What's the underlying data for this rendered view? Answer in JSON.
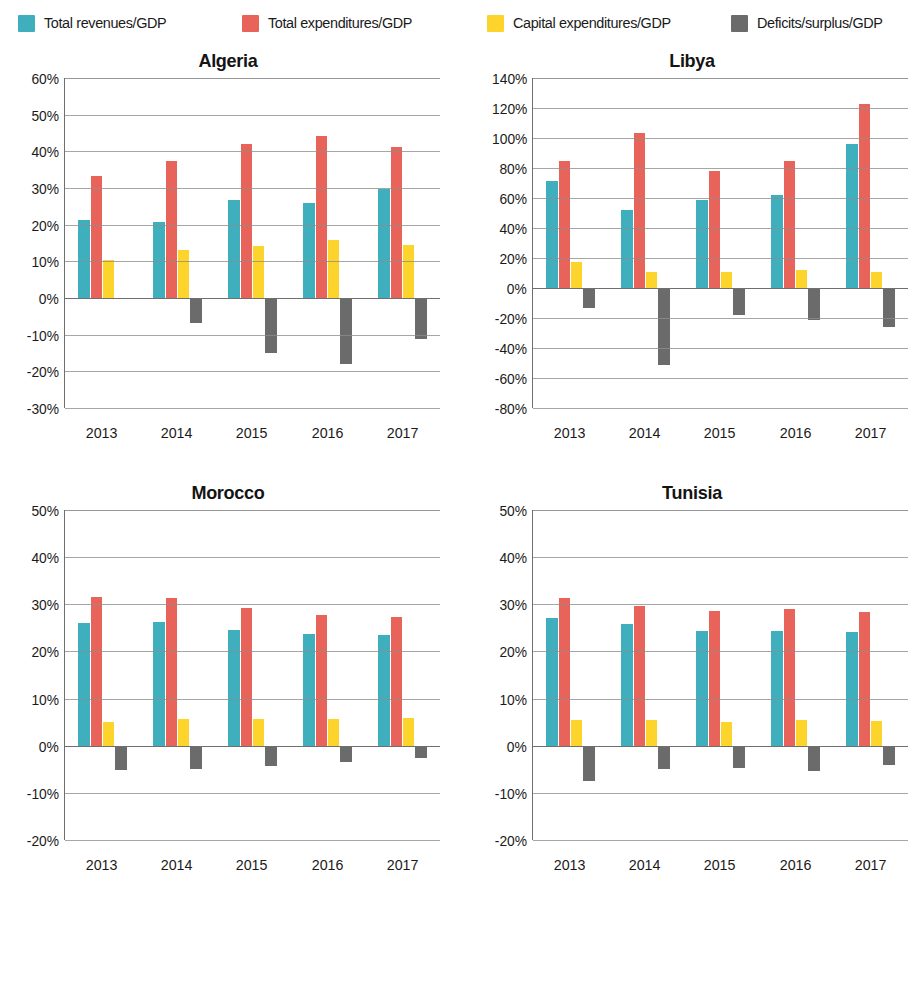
{
  "legend": {
    "items": [
      {
        "label": "Total revenues/GDP",
        "color": "#3FAFBE",
        "x": 18,
        "icon": "legend-swatch-teal"
      },
      {
        "label": "Total expenditures/GDP",
        "color": "#E8635A",
        "x": 242,
        "icon": "legend-swatch-red"
      },
      {
        "label": "Capital expenditures/GDP",
        "color": "#FCD42B",
        "x": 487,
        "icon": "legend-swatch-yellow"
      },
      {
        "label": "Deficits/surplus/GDP",
        "color": "#6B6B6B",
        "x": 731,
        "icon": "legend-swatch-gray"
      }
    ]
  },
  "colors": {
    "revenues": "#3FAFBE",
    "expenditures": "#E8635A",
    "capital": "#FCD42B",
    "deficit": "#6B6B6B",
    "axis": "#6F6F6F",
    "grid": "#8D8D8D",
    "text": "#1A1A1A"
  },
  "chart_data": [
    {
      "type": "bar",
      "title": "Algeria",
      "xlabel": "",
      "ylabel": "",
      "categories": [
        "2013",
        "2014",
        "2015",
        "2016",
        "2017"
      ],
      "ylim": [
        -30,
        60
      ],
      "ytick_step": 10,
      "ytick_labels": [
        "60%",
        "50%",
        "40%",
        "30%",
        "20%",
        "10%",
        "0%",
        "-10%",
        "-20%",
        "-30%"
      ],
      "grid": true,
      "legend_position": "top",
      "series": [
        {
          "name": "Total revenues/GDP",
          "color": "#3FAFBE",
          "values": [
            21.4,
            20.8,
            26.8,
            26.0,
            29.6
          ]
        },
        {
          "name": "Total expenditures/GDP",
          "color": "#E8635A",
          "values": [
            33.3,
            37.4,
            42.1,
            44.3,
            41.2
          ]
        },
        {
          "name": "Capital expenditures/GDP",
          "color": "#FCD42B",
          "values": [
            10.3,
            13.2,
            14.1,
            15.7,
            14.4
          ]
        },
        {
          "name": "Deficits/surplus/GDP",
          "color": "#6B6B6B",
          "values": [
            -0.3,
            -6.8,
            -15.0,
            -18.0,
            -11.2
          ]
        }
      ]
    },
    {
      "type": "bar",
      "title": "Libya",
      "xlabel": "",
      "ylabel": "",
      "categories": [
        "2013",
        "2014",
        "2015",
        "2016",
        "2017"
      ],
      "ylim": [
        -80,
        140
      ],
      "ytick_step": 20,
      "ytick_labels": [
        "140%",
        "120%",
        "100%",
        "80%",
        "60%",
        "40%",
        "20%",
        "0%",
        "-20%",
        "-40%",
        "-60%",
        "-80%"
      ],
      "grid": true,
      "legend_position": "top",
      "series": [
        {
          "name": "Total revenues/GDP",
          "color": "#3FAFBE",
          "values": [
            71.5,
            52.0,
            58.5,
            62.0,
            96.0
          ]
        },
        {
          "name": "Total expenditures/GDP",
          "color": "#E8635A",
          "values": [
            85.0,
            103.5,
            78.0,
            85.0,
            122.5
          ]
        },
        {
          "name": "Capital expenditures/GDP",
          "color": "#FCD42B",
          "values": [
            17.5,
            10.5,
            11.0,
            12.0,
            11.0
          ]
        },
        {
          "name": "Deficits/surplus/GDP",
          "color": "#6B6B6B",
          "values": [
            -13.0,
            -51.0,
            -18.0,
            -21.0,
            -26.0
          ]
        }
      ]
    },
    {
      "type": "bar",
      "title": "Morocco",
      "xlabel": "",
      "ylabel": "",
      "categories": [
        "2013",
        "2014",
        "2015",
        "2016",
        "2017"
      ],
      "ylim": [
        -20,
        50
      ],
      "ytick_step": 10,
      "ytick_labels": [
        "50%",
        "40%",
        "30%",
        "20%",
        "10%",
        "0%",
        "-10%",
        "-20%"
      ],
      "grid": true,
      "legend_position": "top",
      "series": [
        {
          "name": "Total revenues/GDP",
          "color": "#3FAFBE",
          "values": [
            26.1,
            26.3,
            24.5,
            23.8,
            23.4
          ]
        },
        {
          "name": "Total expenditures/GDP",
          "color": "#E8635A",
          "values": [
            31.6,
            31.4,
            29.2,
            27.8,
            27.2
          ]
        },
        {
          "name": "Capital expenditures/GDP",
          "color": "#FCD42B",
          "values": [
            5.0,
            5.6,
            5.6,
            5.7,
            5.8
          ]
        },
        {
          "name": "Deficits/surplus/GDP",
          "color": "#6B6B6B",
          "values": [
            -5.2,
            -4.9,
            -4.4,
            -3.5,
            -2.7
          ]
        }
      ]
    },
    {
      "type": "bar",
      "title": "Tunisia",
      "xlabel": "",
      "ylabel": "",
      "categories": [
        "2013",
        "2014",
        "2015",
        "2016",
        "2017"
      ],
      "ylim": [
        -20,
        50
      ],
      "ytick_step": 10,
      "ytick_labels": [
        "50%",
        "40%",
        "30%",
        "20%",
        "10%",
        "0%",
        "-10%",
        "-20%"
      ],
      "grid": true,
      "legend_position": "top",
      "series": [
        {
          "name": "Total revenues/GDP",
          "color": "#3FAFBE",
          "values": [
            27.1,
            25.8,
            24.3,
            24.3,
            24.2
          ]
        },
        {
          "name": "Total expenditures/GDP",
          "color": "#E8635A",
          "values": [
            31.3,
            29.7,
            28.6,
            29.1,
            28.3
          ]
        },
        {
          "name": "Capital expenditures/GDP",
          "color": "#FCD42B",
          "values": [
            5.5,
            5.5,
            5.1,
            5.5,
            5.2
          ]
        },
        {
          "name": "Deficits/surplus/GDP",
          "color": "#6B6B6B",
          "values": [
            -7.5,
            -5.0,
            -4.8,
            -5.4,
            -4.0
          ]
        }
      ]
    }
  ]
}
